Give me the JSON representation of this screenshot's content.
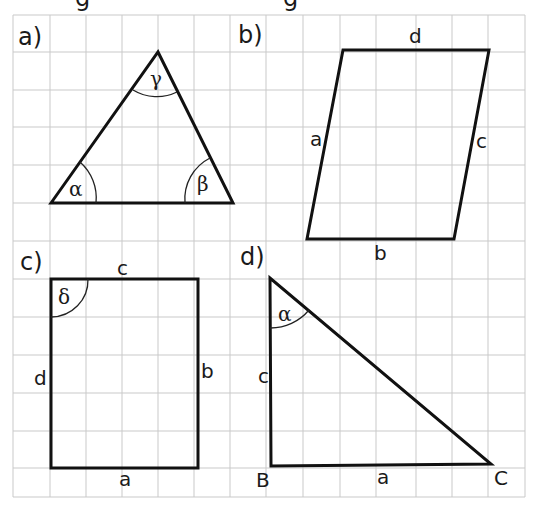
{
  "colors": {
    "background": "#ffffff",
    "grid": "#c9c9c9",
    "stroke": "#111111",
    "text": "#1a1a1a"
  },
  "grid": {
    "x_lines": [
      13,
      50,
      86,
      122,
      158,
      194,
      230,
      266,
      303,
      340,
      376,
      416,
      452,
      488,
      525
    ],
    "y_lines": [
      15,
      52,
      90,
      127,
      165,
      203,
      241,
      279,
      317,
      355,
      393,
      431,
      468,
      497
    ]
  },
  "panels": {
    "a": {
      "label": "a)",
      "shape": "triangle",
      "vertices": [
        [
          51,
          203
        ],
        [
          158,
          52
        ],
        [
          233,
          203
        ]
      ],
      "angles": {
        "alpha": "α",
        "beta": "β",
        "gamma": "γ"
      }
    },
    "b": {
      "label": "b)",
      "shape": "parallelogram",
      "vertices": [
        [
          343,
          50
        ],
        [
          489,
          50
        ],
        [
          454,
          239
        ],
        [
          307,
          239
        ]
      ],
      "sides": {
        "a": "a",
        "b": "b",
        "c": "c",
        "d": "d"
      }
    },
    "c": {
      "label": "c)",
      "shape": "rectangle",
      "vertices": [
        [
          51,
          279
        ],
        [
          198,
          279
        ],
        [
          198,
          468
        ],
        [
          51,
          468
        ]
      ],
      "sides": {
        "a": "a",
        "b": "b",
        "c": "c",
        "d": "d"
      },
      "angles": {
        "delta": "δ"
      }
    },
    "d": {
      "label": "d)",
      "shape": "right-triangle",
      "vertices": [
        [
          270,
          278
        ],
        [
          271,
          466
        ],
        [
          491,
          464
        ]
      ],
      "sides": {
        "a": "a",
        "c": "c"
      },
      "points": {
        "B": "B",
        "C": "C"
      },
      "angles": {
        "alpha": "α"
      }
    }
  },
  "cut_text": "g                                      g"
}
